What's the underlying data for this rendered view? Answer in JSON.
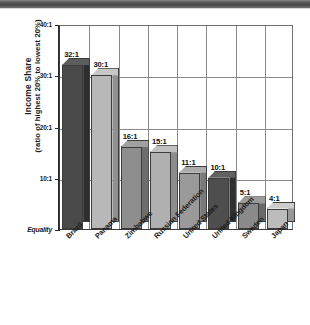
{
  "chart_data": {
    "type": "bar",
    "title": "",
    "subtitle": "",
    "xlabel": "",
    "ylabel_line1": "Income Share",
    "ylabel_line2": "(ratio of highest 20% to lowest 20%)",
    "categories": [
      "Brazil",
      "Panama",
      "Zimbabwe",
      "Russian Federation",
      "United States",
      "United Kingdom",
      "Sweden",
      "Japan"
    ],
    "values": [
      32,
      30,
      16,
      15,
      11,
      10,
      5,
      4
    ],
    "data_labels": [
      "32:1",
      "30:1",
      "16:1",
      "15:1",
      "11:1",
      "10:1",
      "5:1",
      "4:1"
    ],
    "ylim": [
      0,
      40
    ],
    "yticks": [
      0,
      10,
      20,
      30,
      40
    ],
    "ytick_labels": [
      "Equality",
      "10:1",
      "20:1",
      "30:1",
      "40:1"
    ],
    "grid": "both",
    "legend": "none",
    "bar_colors": [
      "#4a4a4a",
      "#b8b8b8",
      "#8e8e8e",
      "#b0b0b0",
      "#9a9a9a",
      "#4e4e4e",
      "#8a8a8a",
      "#bcbcbc"
    ],
    "bar_top_colors": [
      "#5d5d5d",
      "#c8c8c8",
      "#a0a0a0",
      "#c0c0c0",
      "#ababab",
      "#616161",
      "#9c9c9c",
      "#cccccc"
    ],
    "bar_side_colors": [
      "#2e2e2e",
      "#909090",
      "#6e6e6e",
      "#8c8c8c",
      "#7a7a7a",
      "#303030",
      "#6a6a6a",
      "#989898"
    ]
  },
  "colors": {
    "frame": "#6e6e6e",
    "axis": "#2b2b2b",
    "grid": "#8a8a8a",
    "text": "#1a1a1a",
    "header_strip": "#4f4f4f"
  }
}
